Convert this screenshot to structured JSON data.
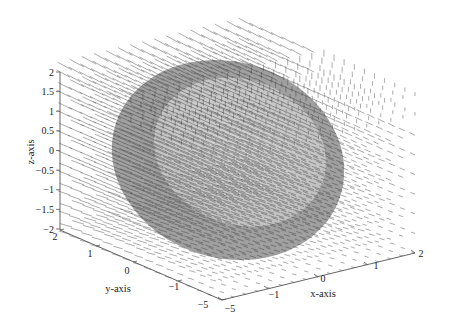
{
  "chart_data": {
    "type": "quiver3d",
    "title": "",
    "xlabel": "x-axis",
    "ylabel": "y-axis",
    "zlabel": "z-axis",
    "x_ticks": [
      "-5",
      "-1",
      "0",
      "1",
      "2"
    ],
    "y_ticks": [
      "2",
      "1",
      "0",
      "-1",
      "-5"
    ],
    "z_ticks": [
      "2",
      "1.5",
      "1",
      "0.5",
      "0",
      "-0.5",
      "-1",
      "-1.5",
      "-2"
    ],
    "z_range": [
      -2,
      2
    ],
    "x_range": [
      -2,
      2
    ],
    "y_range": [
      -2,
      2
    ],
    "grid": false,
    "surface": {
      "shape": "ellipsoid",
      "outer_color": "#8c8c8c",
      "inner_color": "#c8c8c8"
    },
    "arrow_color": "#333333"
  },
  "axes": {
    "z_axis_label": "z-axis",
    "y_axis_label": "y-axis",
    "x_axis_label": "x-axis"
  }
}
